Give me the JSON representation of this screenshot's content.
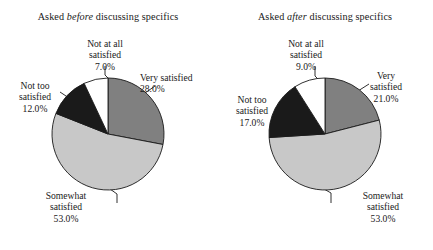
{
  "figure": {
    "background": "#ffffff",
    "text_color": "#1a1a1a"
  },
  "chart_data": [
    {
      "type": "pie",
      "title_prefix": "Asked ",
      "title_emphasis": "before",
      "title_suffix": " discussing specifics",
      "title": "Asked before discussing specifics",
      "categories": [
        "Very satisfied",
        "Somewhat satisfied",
        "Not too satisfied",
        "Not at all satisfied"
      ],
      "values": [
        28.0,
        53.0,
        12.0,
        7.0
      ],
      "value_labels": [
        "28.0%",
        "53.0%",
        "12.0%",
        "7.0%"
      ],
      "colors": [
        "#808080",
        "#c8c8c8",
        "#1a1a1a",
        "#ffffff"
      ],
      "start_angle_deg": 0,
      "direction": "clockwise",
      "legend": "none",
      "grid": false,
      "labels": [
        {
          "name": "very-satisfied",
          "lines": [
            "Very satisfied",
            "28.0%"
          ],
          "x": 148,
          "y": 74,
          "align": "left"
        },
        {
          "name": "somewhat-satisfied",
          "lines": [
            "Somewhat",
            "satisfied",
            "53.0%"
          ],
          "x": 28,
          "y": 190,
          "align": "center"
        },
        {
          "name": "not-too-satisfied",
          "lines": [
            "Not too",
            "satisfied",
            "12.0%"
          ],
          "x": 6,
          "y": 82,
          "align": "center"
        },
        {
          "name": "not-at-all-satisfied",
          "lines": [
            "Not at all",
            "satisfied",
            "7.0%"
          ],
          "x": 63,
          "y": 40,
          "align": "center"
        }
      ]
    },
    {
      "type": "pie",
      "title_prefix": "Asked ",
      "title_emphasis": "after",
      "title_suffix": " discussing specifics",
      "title": "Asked after discussing specifics",
      "categories": [
        "Very satisfied",
        "Somewhat satisfied",
        "Not too satisfied",
        "Not at all satisfied"
      ],
      "values": [
        21.0,
        53.0,
        17.0,
        9.0
      ],
      "value_labels": [
        "21.0%",
        "53.0%",
        "17.0%",
        "9.0%"
      ],
      "colors": [
        "#808080",
        "#c8c8c8",
        "#1a1a1a",
        "#ffffff"
      ],
      "start_angle_deg": 0,
      "direction": "clockwise",
      "legend": "none",
      "grid": false,
      "labels": [
        {
          "name": "very-satisfied",
          "lines": [
            "Very",
            "satisfied",
            "21.0%"
          ],
          "x": 150,
          "y": 70,
          "align": "center"
        },
        {
          "name": "somewhat-satisfied",
          "lines": [
            "Somewhat",
            "satisfied",
            "53.0%"
          ],
          "x": 120,
          "y": 190,
          "align": "center"
        },
        {
          "name": "not-too-satisfied",
          "lines": [
            "Not too",
            "satisfied",
            "17.0%"
          ],
          "x": 2,
          "y": 96,
          "align": "center"
        },
        {
          "name": "not-at-all-satisfied",
          "lines": [
            "Not at all",
            "satisfied",
            "9.0%"
          ],
          "x": 47,
          "y": 40,
          "align": "center"
        }
      ]
    }
  ]
}
